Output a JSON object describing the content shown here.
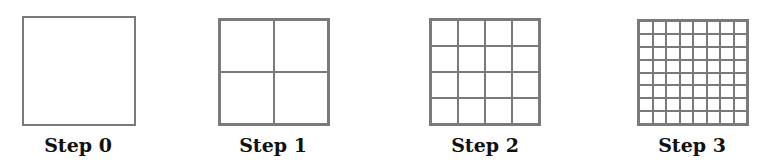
{
  "figure": {
    "line_color": "#7a7a7a",
    "steps": [
      {
        "label": "Step 0",
        "divisions": 1,
        "x": 22,
        "y": 16,
        "w": 114,
        "h": 110,
        "label_center_x": 78
      },
      {
        "label": "Step 1",
        "divisions": 2,
        "x": 218,
        "y": 18,
        "w": 112,
        "h": 108,
        "label_center_x": 273
      },
      {
        "label": "Step 2",
        "divisions": 4,
        "x": 429,
        "y": 18,
        "w": 112,
        "h": 108,
        "label_center_x": 485
      },
      {
        "label": "Step 3",
        "divisions": 8,
        "x": 637,
        "y": 19,
        "w": 112,
        "h": 107,
        "label_center_x": 692
      }
    ]
  }
}
